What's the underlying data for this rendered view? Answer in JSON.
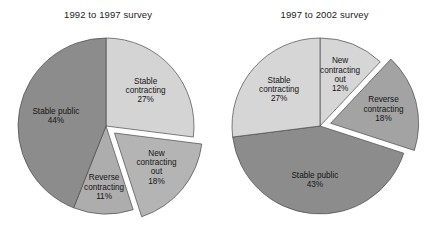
{
  "figure": {
    "background_color": "#ffffff",
    "text_color": "#141414"
  },
  "charts": [
    {
      "id": "survey-1992-1997",
      "title": "1992 to 1997 survey",
      "slices": [
        {
          "label_line1": "Stable",
          "label_line2": "contracting",
          "label_line3": "",
          "percent_text": "27%",
          "color": "#d4d4d4"
        },
        {
          "label_line1": "New",
          "label_line2": "contracting",
          "label_line3": "out",
          "percent_text": "18%",
          "color": "#b4b4b4"
        },
        {
          "label_line1": "Reverse",
          "label_line2": "contracting",
          "label_line3": "",
          "percent_text": "11%",
          "color": "#adadad"
        },
        {
          "label_line1": "Stable public",
          "label_line2": "",
          "label_line3": "",
          "percent_text": "44%",
          "color": "#8c8c8c"
        }
      ]
    },
    {
      "id": "survey-1997-2002",
      "title": "1997 to 2002 survey",
      "slices": [
        {
          "label_line1": "New",
          "label_line2": "contracting",
          "label_line3": "out",
          "percent_text": "12%",
          "color": "#d6d6d6"
        },
        {
          "label_line1": "Reverse",
          "label_line2": "contracting",
          "label_line3": "",
          "percent_text": "18%",
          "color": "#a3a3a3"
        },
        {
          "label_line1": "Stable public",
          "label_line2": "",
          "label_line3": "",
          "percent_text": "43%",
          "color": "#8c8c8c"
        },
        {
          "label_line1": "Stable",
          "label_line2": "contracting",
          "label_line3": "",
          "percent_text": "27%",
          "color": "#d6d6d6"
        }
      ]
    }
  ],
  "chart_data": [
    {
      "type": "pie",
      "title": "1992 to 1997 survey",
      "categories": [
        "Stable contracting",
        "New contracting out",
        "Reverse contracting",
        "Stable public"
      ],
      "values": [
        27,
        18,
        11,
        44
      ],
      "unit": "percent",
      "exploded": [
        "New contracting out"
      ],
      "start_angle_deg": 0,
      "direction": "clockwise",
      "colors": [
        "#d4d4d4",
        "#b4b4b4",
        "#adadad",
        "#8c8c8c"
      ],
      "legend": "none (labels inside slices)",
      "xlabel": "",
      "ylabel": ""
    },
    {
      "type": "pie",
      "title": "1997 to 2002 survey",
      "categories": [
        "New contracting out",
        "Reverse contracting",
        "Stable public",
        "Stable contracting"
      ],
      "values": [
        12,
        18,
        43,
        27
      ],
      "unit": "percent",
      "exploded": [
        "Reverse contracting"
      ],
      "start_angle_deg": 0,
      "direction": "clockwise",
      "colors": [
        "#d6d6d6",
        "#a3a3a3",
        "#8c8c8c",
        "#d6d6d6"
      ],
      "legend": "none (labels inside slices)",
      "xlabel": "",
      "ylabel": ""
    }
  ]
}
